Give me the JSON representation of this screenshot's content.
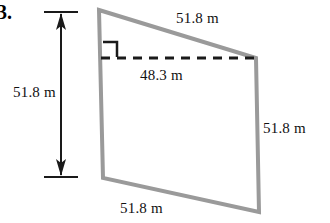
{
  "problem": {
    "number": "3."
  },
  "figure": {
    "type": "quadrilateral-with-altitude",
    "shape_color": "#9a9a9a",
    "dashed_color": "#1a1a1a",
    "arrow_color": "#1a1a1a",
    "labels": {
      "left_height": "51.8 m",
      "top_side": "51.8 m",
      "diagonal": "48.3 m",
      "right_side": "51.8 m",
      "bottom_side": "51.8 m"
    },
    "markers": {
      "right_angle": "right-angle-square",
      "dimension_arrow": "double-headed-vertical-arrow"
    }
  }
}
